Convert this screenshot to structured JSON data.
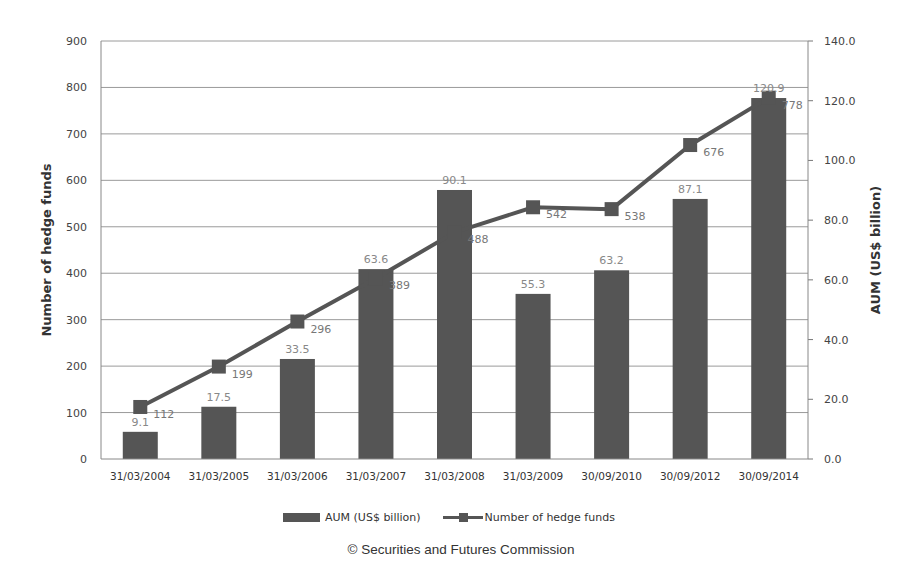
{
  "chart_data": {
    "type": "bar",
    "combo": "bar+line (dual axis)",
    "title": "",
    "categories": [
      "31/03/2004",
      "31/03/2005",
      "31/03/2006",
      "31/03/2007",
      "31/03/2008",
      "31/03/2009",
      "30/09/2010",
      "30/09/2012",
      "30/09/2014"
    ],
    "series": [
      {
        "name": "AUM (US$ billion)",
        "type": "bar",
        "axis": "right",
        "color": "#555555",
        "values": [
          9.1,
          17.5,
          33.5,
          63.6,
          90.1,
          55.3,
          63.2,
          87.1,
          120.9
        ],
        "labels": [
          "9.1",
          "17.5",
          "33.5",
          "63.6",
          "90.1",
          "55.3",
          "63.2",
          "87.1",
          "120.9"
        ]
      },
      {
        "name": "Number of hedge funds",
        "type": "line",
        "marker": "square",
        "axis": "left",
        "color": "#555555",
        "values": [
          112,
          199,
          296,
          389,
          488,
          542,
          538,
          676,
          778
        ],
        "labels": [
          "112",
          "199",
          "296",
          "389",
          "488",
          "542",
          "538",
          "676",
          "778"
        ]
      }
    ],
    "left_axis": {
      "label": "Number of hedge funds",
      "range": [
        0,
        900
      ],
      "ticks": [
        "0",
        "100",
        "200",
        "300",
        "400",
        "500",
        "600",
        "700",
        "800",
        "900"
      ]
    },
    "right_axis": {
      "label": "AUM (US$ billion)",
      "range": [
        0,
        140
      ],
      "ticks": [
        "0.0",
        "20.0",
        "40.0",
        "60.0",
        "80.0",
        "100.0",
        "120.0",
        "140.0"
      ]
    },
    "grid": true,
    "legend_position": "bottom"
  },
  "legend": {
    "bar_label": "AUM (US$ billion)",
    "line_label": "Number of hedge funds"
  },
  "source": "© Securities and Futures Commission"
}
